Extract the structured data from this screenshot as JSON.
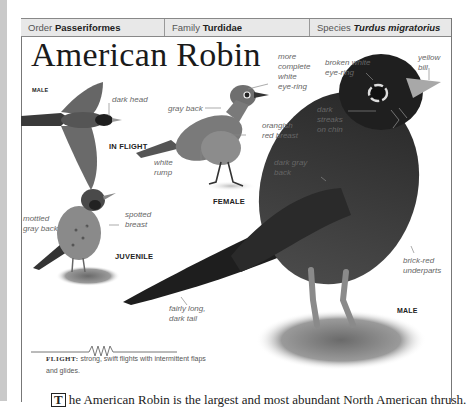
{
  "header": {
    "order_label": "Order",
    "order_value": "Passeriformes",
    "family_label": "Family",
    "family_value": "Turdidae",
    "species_label": "Species",
    "species_value": "Turdus migratorius"
  },
  "title": "American Robin",
  "figures": {
    "flight": {
      "tag_sex": "MALE",
      "tag_view": "IN FLIGHT",
      "labels": [
        "dark head"
      ]
    },
    "female": {
      "tag": "FEMALE",
      "labels": [
        "gray back",
        "more complete white eye-ring",
        "orangish red breast",
        "white rump"
      ]
    },
    "juvenile": {
      "tag": "JUVENILE",
      "labels": [
        "mottled gray back",
        "spotted breast"
      ]
    },
    "male": {
      "tag": "MALE",
      "labels": [
        "broken white eye-ring",
        "yellow bill",
        "dark streaks on chin",
        "dark gray back",
        "brick-red underparts",
        "fairly long, dark tail"
      ]
    }
  },
  "labels": {
    "dark_head": "dark head",
    "gray_back": "gray back",
    "more_complete_1": "more",
    "more_complete_2": "complete",
    "more_complete_3": "white",
    "more_complete_4": "eye-ring",
    "orangish_1": "orangish",
    "orangish_2": "red breast",
    "white_rump_1": "white",
    "white_rump_2": "rump",
    "broken_1": "broken white",
    "broken_2": "eye-ring",
    "yellow_1": "yellow",
    "yellow_2": "bill",
    "streaks_1": "dark",
    "streaks_2": "streaks",
    "streaks_3": "on chin",
    "darkgray_1": "dark gray",
    "darkgray_2": "back",
    "mottled_1": "mottled",
    "mottled_2": "gray back",
    "spotted_1": "spotted",
    "spotted_2": "breast",
    "brick_1": "brick-red",
    "brick_2": "underparts",
    "tail_1": "fairly long,",
    "tail_2": "dark tail"
  },
  "tags": {
    "male_flight": "MALE",
    "in_flight": "IN FLIGHT",
    "female": "FEMALE",
    "juvenile": "JUVENILE",
    "male": "MALE"
  },
  "flight_pattern": {
    "label": "FLIGHT:",
    "text": "strong, swift flights with intermittent flaps and glides."
  },
  "body_text": {
    "dropcap": "T",
    "text": "he American Robin is the largest and most abundant North American thrush."
  }
}
